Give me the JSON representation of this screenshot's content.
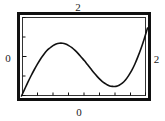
{
  "figure": {
    "kind": "function-plot",
    "background_color": "#ffffff",
    "frame_color": "#111111"
  },
  "labels": {
    "top": "2",
    "left": "0",
    "right": "2",
    "bottom": "0"
  },
  "chart_data": {
    "type": "line",
    "title": "",
    "xlabel": "",
    "ylabel": "",
    "xlim": [
      0,
      2
    ],
    "ylim": [
      0,
      2
    ],
    "grid": false,
    "legend": null,
    "axis_tick_labels": {
      "x_left": "0",
      "x_right": "2",
      "y_bottom": "0",
      "y_top": "2"
    },
    "x_ticks": [
      0,
      0.25,
      0.5,
      0.75,
      1.0,
      1.25,
      1.5,
      1.75,
      2.0
    ],
    "y_ticks": [
      0,
      0.5,
      1.0,
      1.5,
      2.0
    ],
    "series": [
      {
        "name": "curve",
        "color": "#111111",
        "x": [
          0.0,
          0.05,
          0.1,
          0.15,
          0.2,
          0.25,
          0.3,
          0.35,
          0.4,
          0.45,
          0.5,
          0.55,
          0.6,
          0.65,
          0.7,
          0.75,
          0.8,
          0.85,
          0.9,
          0.95,
          1.0,
          1.05,
          1.1,
          1.15,
          1.2,
          1.25,
          1.3,
          1.35,
          1.4,
          1.45,
          1.5,
          1.55,
          1.6,
          1.65,
          1.7,
          1.75,
          1.8,
          1.85,
          1.9,
          1.95,
          2.0
        ],
        "y": [
          0.0,
          0.17,
          0.34,
          0.5,
          0.65,
          0.79,
          0.92,
          1.03,
          1.13,
          1.2,
          1.26,
          1.3,
          1.32,
          1.32,
          1.3,
          1.26,
          1.21,
          1.14,
          1.06,
          0.97,
          0.88,
          0.78,
          0.68,
          0.58,
          0.49,
          0.41,
          0.34,
          0.29,
          0.25,
          0.24,
          0.24,
          0.27,
          0.32,
          0.4,
          0.51,
          0.64,
          0.8,
          0.99,
          1.2,
          1.44,
          1.7
        ]
      }
    ]
  }
}
